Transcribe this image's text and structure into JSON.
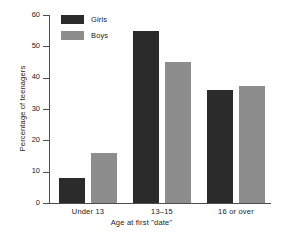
{
  "chart_data": {
    "type": "bar",
    "title": "",
    "xlabel": "Age at first \"date\"",
    "ylabel": "Percentage of teenagers",
    "categories": [
      "Under 13",
      "13–15",
      "16 or over"
    ],
    "series": [
      {
        "name": "Girls",
        "color": "#2b2b2b",
        "values": [
          8,
          55,
          36
        ]
      },
      {
        "name": "Boys",
        "color": "#8d8d8d",
        "values": [
          16,
          45,
          37.5
        ]
      }
    ],
    "ylim": [
      0,
      60
    ],
    "yticks": [
      0,
      10,
      20,
      30,
      40,
      50,
      60
    ],
    "ytick_labels": [
      "0",
      "10",
      "20",
      "30",
      "40",
      "50",
      "60"
    ],
    "grid": false,
    "legend_position": "top-left",
    "legend": [
      {
        "label": "Girls",
        "color": "#2b2b2b"
      },
      {
        "label": "Boys",
        "color": "#8d8d8d"
      }
    ]
  },
  "axis": {
    "line_color": "#4d4d4d"
  }
}
